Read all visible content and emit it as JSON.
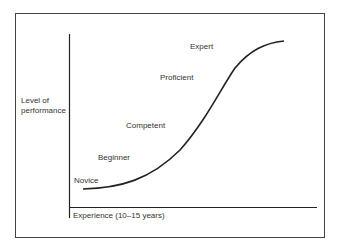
{
  "diagram": {
    "y_axis_label": "Level of performance",
    "y_axis_label_lines": [
      "Level of",
      "performance"
    ],
    "x_axis_label": "Experience (10–15 years)",
    "stages": [
      {
        "label": "Novice"
      },
      {
        "label": "Beginner"
      },
      {
        "label": "Competent"
      },
      {
        "label": "Proficient"
      },
      {
        "label": "Expert"
      }
    ],
    "curve": "S-shaped (sigmoid) learning curve",
    "colors": {
      "line": "#222222",
      "text": "#333333",
      "frame": "#444444"
    }
  }
}
